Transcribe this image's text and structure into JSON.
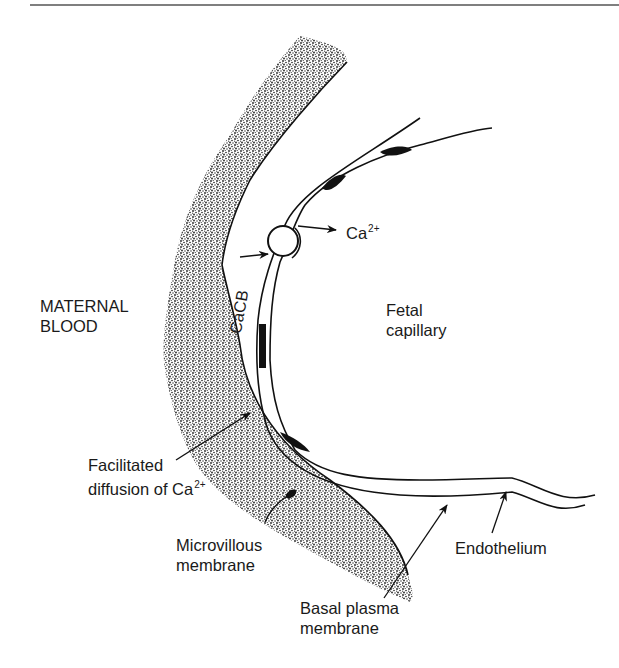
{
  "figure": {
    "regions": {
      "maternal_blood": [
        "MATERNAL",
        "BLOOD"
      ],
      "fetal_capillary": [
        "Fetal",
        "capillary"
      ]
    },
    "calcium_binding_protein": "CaCB",
    "ion_out": {
      "base": "Ca",
      "charge": "2+"
    },
    "facilitated_diffusion": {
      "line1": "Facilitated",
      "line2_base": "diffusion of Ca",
      "charge": "2+"
    },
    "microvillous_membrane": [
      "Microvillous",
      "membrane"
    ],
    "endothelium": "Endothelium",
    "basal_plasma_membrane": [
      "Basal plasma",
      "membrane"
    ],
    "colors": {
      "ink": "#111111",
      "stipple": "#2a2a2a",
      "background": "#ffffff"
    }
  }
}
